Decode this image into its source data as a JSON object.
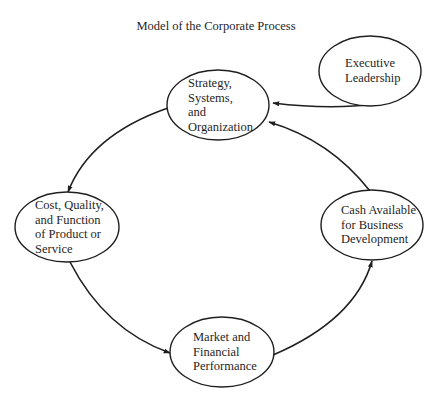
{
  "title": "Model of the Corporate Process",
  "nodes": [
    {
      "id": "strategy",
      "lines": [
        "Strategy,",
        "Systems,",
        "and",
        "Organization"
      ]
    },
    {
      "id": "executive",
      "lines": [
        "Executive",
        "Leadership"
      ]
    },
    {
      "id": "cost",
      "lines": [
        "Cost, Quality,",
        "and Function",
        "of Product or",
        "Service"
      ]
    },
    {
      "id": "cash",
      "lines": [
        "Cash Available",
        "for Business",
        "Development"
      ]
    },
    {
      "id": "market",
      "lines": [
        "Market and",
        "Financial",
        "Performance"
      ]
    }
  ],
  "edges": [
    {
      "from": "executive",
      "to": "strategy"
    },
    {
      "from": "cash",
      "to": "strategy"
    },
    {
      "from": "strategy",
      "to": "cost"
    },
    {
      "from": "cost",
      "to": "market"
    },
    {
      "from": "market",
      "to": "cash"
    }
  ],
  "colors": {
    "ink": "#1f1f1f",
    "background": "#ffffff"
  }
}
